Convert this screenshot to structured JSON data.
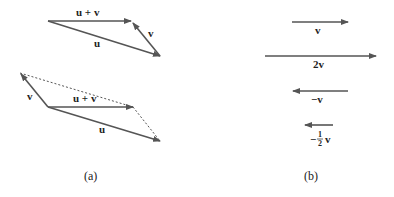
{
  "colors": {
    "arrow": "#555555",
    "text": "#222222",
    "dashed": "#555555"
  },
  "panel_a": {
    "caption": "(a)",
    "triangle": {
      "labels": {
        "u_plus_v": "u + v",
        "v": "v",
        "u": "u"
      }
    },
    "parallelogram": {
      "labels": {
        "v": "v",
        "u_plus_v": "u + v",
        "u": "u"
      }
    }
  },
  "panel_b": {
    "caption": "(b)",
    "labels": {
      "v": "v",
      "two_v": "2v",
      "neg_v": "−v",
      "neg_half_prefix": "−",
      "half_num": "1",
      "half_den": "2",
      "neg_half_v": "v"
    }
  }
}
